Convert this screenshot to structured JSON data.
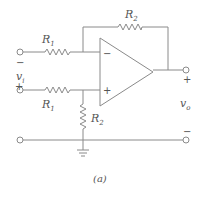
{
  "diagram": {
    "type": "op-amp differential amplifier circuit",
    "caption": "(a)",
    "components": {
      "r1_top": {
        "label": "R",
        "subscript": "1"
      },
      "r1_bottom": {
        "label": "R",
        "subscript": "1"
      },
      "r2_feedback": {
        "label": "R",
        "subscript": "2"
      },
      "r2_ground": {
        "label": "R",
        "subscript": "2"
      },
      "opamp": {
        "inverting_sign": "−",
        "noninverting_sign": "+"
      }
    },
    "input": {
      "label": "v",
      "subscript": "i",
      "plus": "+",
      "minus": "−"
    },
    "output": {
      "label": "v",
      "subscript": "o",
      "plus": "+",
      "minus": "−"
    },
    "colors": {
      "line": "#8a8a8a",
      "text": "#555555",
      "background": "#ffffff"
    }
  }
}
